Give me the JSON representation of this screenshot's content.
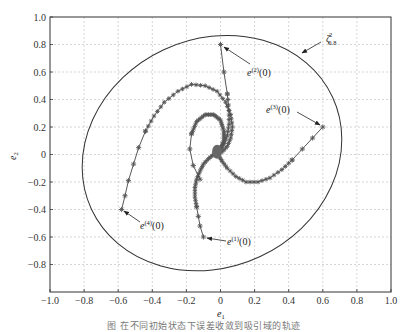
{
  "chart_data": {
    "type": "scatter",
    "title": "",
    "xlabel": "e1",
    "ylabel": "e2",
    "xlim": [
      -1.0,
      1.0
    ],
    "ylim": [
      -1.0,
      1.0
    ],
    "grid": true,
    "x_ticks": [
      "-1.0",
      "-0.8",
      "-0.6",
      "-0.4",
      "-0.2",
      "0",
      "0.2",
      "0.4",
      "0.6",
      "0.8",
      "1.0"
    ],
    "y_ticks": [
      "1.0",
      "0.8",
      "0.6",
      "0.4",
      "0.2",
      "0",
      "-0.2",
      "-0.4",
      "-0.6",
      "-0.8"
    ],
    "region": {
      "label": "ζ²_{0.8}",
      "shape": "ellipse",
      "center": [
        -0.05,
        0.01
      ],
      "rx": 0.78,
      "ry": 0.83,
      "rotation_deg": -25
    },
    "series": [
      {
        "name": "e(1)(0)",
        "start": [
          -0.1,
          -0.6
        ],
        "points": [
          [
            -0.1,
            -0.6
          ],
          [
            -0.12,
            -0.52
          ],
          [
            -0.13,
            -0.45
          ],
          [
            -0.14,
            -0.38
          ],
          [
            -0.15,
            -0.31
          ],
          [
            -0.15,
            -0.24
          ],
          [
            -0.14,
            -0.18
          ],
          [
            -0.12,
            -0.12
          ],
          [
            -0.1,
            -0.07
          ],
          [
            -0.07,
            -0.03
          ],
          [
            -0.04,
            0.0
          ],
          [
            -0.02,
            0.01
          ]
        ]
      },
      {
        "name": "e(2)(0)",
        "start": [
          0.0,
          0.8
        ],
        "points": [
          [
            0.0,
            0.8
          ],
          [
            0.02,
            0.6
          ],
          [
            0.04,
            0.44
          ],
          [
            0.05,
            0.32
          ],
          [
            0.05,
            0.22
          ],
          [
            0.04,
            0.14
          ],
          [
            0.02,
            0.08
          ],
          [
            0.0,
            0.04
          ],
          [
            -0.02,
            0.02
          ]
        ]
      },
      {
        "name": "e(3)(0)",
        "start": [
          0.6,
          0.2
        ],
        "points": [
          [
            0.6,
            0.2
          ],
          [
            0.54,
            0.12
          ],
          [
            0.48,
            0.04
          ],
          [
            0.42,
            -0.04
          ],
          [
            0.36,
            -0.11
          ],
          [
            0.29,
            -0.17
          ],
          [
            0.22,
            -0.2
          ],
          [
            0.15,
            -0.2
          ],
          [
            0.09,
            -0.16
          ],
          [
            0.04,
            -0.1
          ],
          [
            0.01,
            -0.05
          ],
          [
            -0.01,
            -0.01
          ]
        ]
      },
      {
        "name": "e(4)(0)",
        "start": [
          -0.58,
          -0.4
        ],
        "points": [
          [
            -0.58,
            -0.4
          ],
          [
            -0.56,
            -0.3
          ],
          [
            -0.54,
            -0.19
          ],
          [
            -0.51,
            -0.07
          ],
          [
            -0.48,
            0.05
          ],
          [
            -0.44,
            0.17
          ],
          [
            -0.39,
            0.28
          ],
          [
            -0.33,
            0.38
          ],
          [
            -0.25,
            0.46
          ],
          [
            -0.17,
            0.51
          ],
          [
            -0.09,
            0.5
          ],
          [
            -0.02,
            0.46
          ],
          [
            0.03,
            0.38
          ],
          [
            0.06,
            0.29
          ],
          [
            0.07,
            0.2
          ],
          [
            0.06,
            0.12
          ],
          [
            0.04,
            0.06
          ],
          [
            0.01,
            0.02
          ]
        ]
      }
    ],
    "inner_spiral": [
      [
        -0.12,
        -0.18
      ],
      [
        -0.16,
        -0.08
      ],
      [
        -0.18,
        0.04
      ],
      [
        -0.17,
        0.15
      ],
      [
        -0.14,
        0.24
      ],
      [
        -0.09,
        0.29
      ],
      [
        -0.04,
        0.29
      ],
      [
        0.0,
        0.25
      ],
      [
        0.02,
        0.17
      ],
      [
        0.02,
        0.1
      ],
      [
        0.0,
        0.04
      ],
      [
        -0.02,
        0.01
      ]
    ],
    "annotations": [
      {
        "text": "e(1)(0)",
        "at": [
          -0.1,
          -0.6
        ]
      },
      {
        "text": "e(2)(0)",
        "at": [
          0.0,
          0.8
        ]
      },
      {
        "text": "e(3)(0)",
        "at": [
          0.6,
          0.2
        ]
      },
      {
        "text": "e(4)(0)",
        "at": [
          -0.58,
          -0.4
        ]
      },
      {
        "text": "ζ²_{0.8}",
        "at": [
          0.55,
          0.72
        ]
      }
    ]
  },
  "labels": {
    "xlabel_base": "e",
    "xlabel_sub": "1",
    "ylabel_base": "e",
    "ylabel_sub": "2",
    "zeta_base": "ζ",
    "zeta_sup": "2",
    "zeta_sub": "0.8",
    "e1_base": "e",
    "e1_sup": "(1)",
    "e1_tail": "(0)",
    "e2_base": "e",
    "e2_sup": "(2)",
    "e2_tail": "(0)",
    "e3_base": "e",
    "e3_sup": "(3)",
    "e3_tail": "(0)",
    "e4_base": "e",
    "e4_sup": "(4)",
    "e4_tail": "(0)"
  },
  "caption": "图 在不同初始状态下误差收敛到吸引域的轨迹"
}
